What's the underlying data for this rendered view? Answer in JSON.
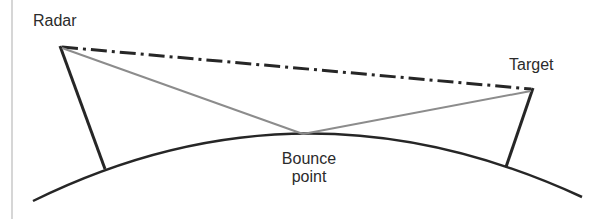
{
  "labels": {
    "radar": "Radar",
    "target": "Target",
    "bounce_line1": "Bounce",
    "bounce_line2": "point"
  },
  "colors": {
    "ground": "#262626",
    "tower": "#262626",
    "direct_path": "#262626",
    "bounce_path": "#8c8c8c",
    "border": "#c8c8c8"
  },
  "geometry": {
    "radar_top": [
      60,
      46
    ],
    "radar_base": [
      105,
      169
    ],
    "target_top": [
      533,
      88
    ],
    "target_base": [
      506,
      167
    ],
    "bounce_point": [
      303,
      134
    ],
    "ground_start": [
      33,
      201
    ],
    "ground_end": [
      582,
      197
    ]
  }
}
